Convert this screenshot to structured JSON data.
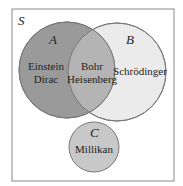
{
  "diagram": {
    "universe_label": "S",
    "sets": [
      {
        "id": "A",
        "label": "A",
        "members_only": [
          "Einstein",
          "Dirac"
        ],
        "color": "#9a9a9a"
      },
      {
        "id": "B",
        "label": "B",
        "members_only": [
          "Schrödinger"
        ],
        "color": "#ebebeb"
      },
      {
        "id": "C",
        "label": "C",
        "members_only": [
          "Millikan"
        ],
        "color": "#c8c8c8"
      }
    ],
    "intersection_AB": [
      "Bohr",
      "Heisenberg"
    ],
    "colors": {
      "A": "#9a9a9a",
      "B": "#ebebeb",
      "AB": "#b4b4b4",
      "C": "#c8c8c8",
      "border": "#777777"
    }
  }
}
